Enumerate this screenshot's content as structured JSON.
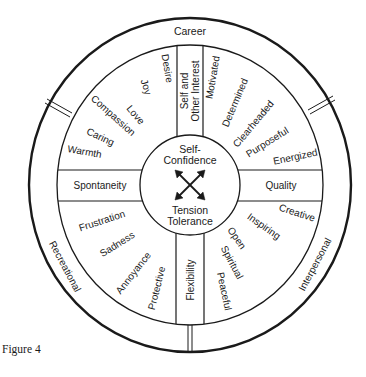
{
  "figure_caption": "Figure 4",
  "outer_ring": {
    "top": "Career",
    "left": "Recreational",
    "right": "Interpersonal"
  },
  "center": {
    "top": [
      "Self-",
      "Confidence"
    ],
    "bottom": [
      "Tension",
      "Tolerance"
    ],
    "icon": "four-way-arrows-icon"
  },
  "bands": {
    "top": [
      "Self and",
      "Other Interest"
    ],
    "left": "Spontaneity",
    "right": "Quality",
    "bottom": "Flexibility"
  },
  "quadrants": {
    "upper_left": [
      "Desire",
      "Joy",
      "Love",
      "Compassion",
      "Caring",
      "Warmth"
    ],
    "upper_right": [
      "Motivated",
      "Determined",
      "Clearheaded",
      "Purposeful",
      "Energized"
    ],
    "lower_left": [
      "Frustration",
      "Sadness",
      "Annoyance",
      "Protective"
    ],
    "lower_right": [
      "Creative",
      "Inspiring",
      "Open",
      "Spiritual",
      "Peaceful"
    ]
  }
}
